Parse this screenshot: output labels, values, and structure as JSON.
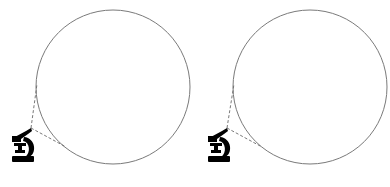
{
  "diagram": {
    "panels": [
      {
        "id": "left",
        "circle": {
          "cx": 113,
          "cy": 87,
          "r": 77
        },
        "microscope": {
          "x": 12,
          "y": 126
        },
        "lines": [
          [
            31,
            128,
            37,
            84
          ],
          [
            31,
            128,
            66,
            147
          ]
        ]
      },
      {
        "id": "right",
        "circle": {
          "cx": 310,
          "cy": 87,
          "r": 77
        },
        "microscope": {
          "x": 208,
          "y": 126
        },
        "lines": [
          [
            227,
            128,
            234,
            84
          ],
          [
            227,
            128,
            262,
            147
          ]
        ]
      }
    ],
    "colors": {
      "circle_stroke": "#7a7a7a",
      "dash": "#6a6a6a",
      "icon": "#000000"
    }
  }
}
